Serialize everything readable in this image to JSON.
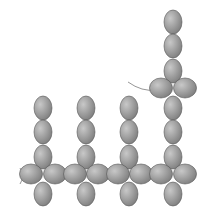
{
  "diagram": {
    "type": "beading-pattern",
    "colors": {
      "background": "#ffffff",
      "bead_fill_light": "#c8c8c8",
      "bead_fill_dark": "#7a7a7a",
      "bead_stroke": "#555555",
      "thread": "#8a8a8a"
    },
    "bead_size": {
      "rx": 9,
      "ry": 12
    },
    "columns": [
      {
        "name": "column-1",
        "x": 43,
        "vertical_beads_y": [
          108,
          132,
          157
        ],
        "cross": {
          "y": 174,
          "left_x": 31,
          "right_x": 55,
          "bottom_y": 194
        }
      },
      {
        "name": "column-2",
        "x": 86,
        "vertical_beads_y": [
          108,
          132,
          157
        ],
        "cross": {
          "y": 174,
          "left_x": 75,
          "right_x": 98,
          "bottom_y": 194
        }
      },
      {
        "name": "column-3",
        "x": 129,
        "vertical_beads_y": [
          108,
          132,
          157
        ],
        "cross": {
          "y": 174,
          "left_x": 118,
          "right_x": 141,
          "bottom_y": 194
        }
      },
      {
        "name": "column-4",
        "x": 173,
        "vertical_beads_y": [
          22,
          46,
          71,
          108,
          132,
          157
        ],
        "upper_cross": {
          "y": 88,
          "left_x": 161,
          "right_x": 185
        },
        "cross": {
          "y": 174,
          "left_x": 161,
          "right_x": 185,
          "bottom_y": 194
        }
      }
    ],
    "threads": [
      {
        "name": "loose-thread-end",
        "path": "M128 82 Q142 92 156 90"
      },
      {
        "name": "start-thread-end",
        "path": "M20 168 L24 176 L20 184"
      }
    ]
  }
}
